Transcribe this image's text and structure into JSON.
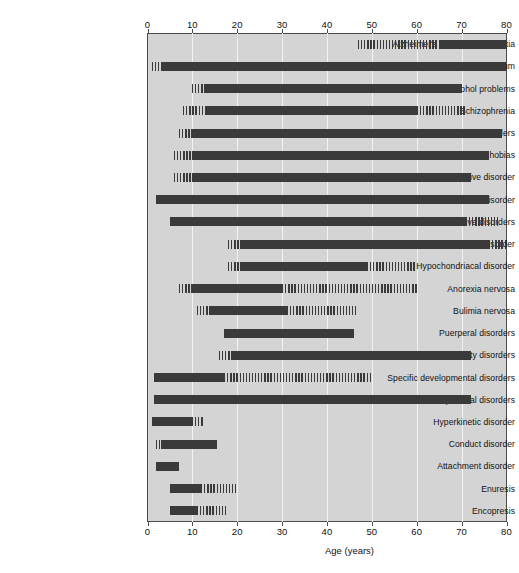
{
  "chart_data": {
    "type": "bar",
    "title": "",
    "subtitle": "",
    "xlabel": "Age (years)",
    "ylabel": "",
    "xlim": [
      0,
      80
    ],
    "xticks": [
      0,
      10,
      20,
      30,
      40,
      50,
      60,
      70,
      80
    ],
    "xtick_labels": [
      "0",
      "10",
      "20",
      "30",
      "40",
      "50",
      "60",
      "70",
      "80"
    ],
    "grid": true,
    "legend": "none",
    "axis_top": true,
    "axis_bottom": true,
    "plot_background": "#d4d4d4",
    "bar_color": "#3a3a3a",
    "segment_kinds": {
      "solid": "typical age range of onset",
      "hatch": "less common / extended age range of onset"
    },
    "categories": [
      "Alzheimer's and vasc. dementia",
      "Delirium",
      "Alcohol problems",
      "Schizophrenia",
      "Mood disorders",
      "Phobias",
      "Obsessive–compulsive disorder",
      "Post-traumatic stress disorder",
      "Dissociative disorders",
      "Somatization disorder",
      "Hypochondriacal disorder",
      "Anorexia nervosa",
      "Bulimia nervosa",
      "Puerperal disorders",
      "Personality disorders",
      "Specific developmental disorders",
      "Pervasive developmental disorders",
      "Hyperkinetic disorder",
      "Conduct disorder",
      "Attachment disorder",
      "Enuresis",
      "Encopresis"
    ],
    "rows": [
      {
        "label": "Alzheimer's and vasc. dementia",
        "segments": [
          {
            "start": 47,
            "end": 65,
            "kind": "hatch"
          },
          {
            "start": 65,
            "end": 80,
            "kind": "solid"
          }
        ]
      },
      {
        "label": "Delirium",
        "segments": [
          {
            "start": 1,
            "end": 3,
            "kind": "hatch"
          },
          {
            "start": 3,
            "end": 80,
            "kind": "solid"
          }
        ]
      },
      {
        "label": "Alcohol problems",
        "segments": [
          {
            "start": 10,
            "end": 13,
            "kind": "hatch"
          },
          {
            "start": 13,
            "end": 70,
            "kind": "solid"
          }
        ]
      },
      {
        "label": "Schizophrenia",
        "segments": [
          {
            "start": 8,
            "end": 13,
            "kind": "hatch"
          },
          {
            "start": 13,
            "end": 60,
            "kind": "solid"
          },
          {
            "start": 60,
            "end": 71,
            "kind": "hatch"
          }
        ]
      },
      {
        "label": "Mood disorders",
        "segments": [
          {
            "start": 7,
            "end": 10,
            "kind": "hatch"
          },
          {
            "start": 10,
            "end": 79,
            "kind": "solid"
          }
        ]
      },
      {
        "label": "Phobias",
        "segments": [
          {
            "start": 6,
            "end": 10,
            "kind": "hatch"
          },
          {
            "start": 10,
            "end": 76,
            "kind": "solid"
          }
        ]
      },
      {
        "label": "Obsessive–compulsive disorder",
        "segments": [
          {
            "start": 6,
            "end": 10,
            "kind": "hatch"
          },
          {
            "start": 10,
            "end": 72,
            "kind": "solid"
          }
        ]
      },
      {
        "label": "Post-traumatic stress disorder",
        "segments": [
          {
            "start": 2,
            "end": 76,
            "kind": "solid"
          }
        ]
      },
      {
        "label": "Dissociative disorders",
        "segments": [
          {
            "start": 5,
            "end": 71,
            "kind": "solid"
          },
          {
            "start": 71,
            "end": 78,
            "kind": "hatch"
          }
        ]
      },
      {
        "label": "Somatization disorder",
        "segments": [
          {
            "start": 18,
            "end": 21,
            "kind": "hatch"
          },
          {
            "start": 21,
            "end": 76,
            "kind": "solid"
          },
          {
            "start": 76,
            "end": 80,
            "kind": "hatch"
          }
        ]
      },
      {
        "label": "Hypochondriacal disorder",
        "segments": [
          {
            "start": 18,
            "end": 21,
            "kind": "hatch"
          },
          {
            "start": 21,
            "end": 49,
            "kind": "solid"
          },
          {
            "start": 49,
            "end": 60,
            "kind": "hatch"
          }
        ]
      },
      {
        "label": "Anorexia nervosa",
        "segments": [
          {
            "start": 7,
            "end": 10,
            "kind": "hatch"
          },
          {
            "start": 10,
            "end": 30,
            "kind": "solid"
          },
          {
            "start": 30,
            "end": 60,
            "kind": "hatch"
          }
        ]
      },
      {
        "label": "Bulimia nervosa",
        "segments": [
          {
            "start": 11,
            "end": 14,
            "kind": "hatch"
          },
          {
            "start": 14,
            "end": 31,
            "kind": "solid"
          },
          {
            "start": 31,
            "end": 47,
            "kind": "hatch"
          }
        ]
      },
      {
        "label": "Puerperal disorders",
        "segments": [
          {
            "start": 17,
            "end": 46,
            "kind": "solid"
          }
        ]
      },
      {
        "label": "Personality disorders",
        "segments": [
          {
            "start": 16,
            "end": 19,
            "kind": "hatch"
          },
          {
            "start": 19,
            "end": 72,
            "kind": "solid"
          }
        ]
      },
      {
        "label": "Specific developmental disorders",
        "segments": [
          {
            "start": 1.5,
            "end": 17,
            "kind": "solid"
          },
          {
            "start": 17,
            "end": 50,
            "kind": "hatch"
          }
        ]
      },
      {
        "label": "Pervasive developmental disorders",
        "segments": [
          {
            "start": 1.5,
            "end": 72,
            "kind": "solid"
          }
        ]
      },
      {
        "label": "Hyperkinetic disorder",
        "segments": [
          {
            "start": 1,
            "end": 10,
            "kind": "solid"
          },
          {
            "start": 10,
            "end": 12.5,
            "kind": "hatch"
          }
        ]
      },
      {
        "label": "Conduct disorder",
        "segments": [
          {
            "start": 2,
            "end": 3,
            "kind": "hatch"
          },
          {
            "start": 3,
            "end": 15.5,
            "kind": "solid"
          }
        ]
      },
      {
        "label": "Attachment disorder",
        "segments": [
          {
            "start": 2,
            "end": 7,
            "kind": "solid"
          }
        ]
      },
      {
        "label": "Enuresis",
        "segments": [
          {
            "start": 5,
            "end": 12,
            "kind": "solid"
          },
          {
            "start": 12,
            "end": 20,
            "kind": "hatch"
          }
        ]
      },
      {
        "label": "Encopresis",
        "segments": [
          {
            "start": 5,
            "end": 11,
            "kind": "solid"
          },
          {
            "start": 11,
            "end": 17.5,
            "kind": "hatch"
          }
        ]
      }
    ]
  }
}
